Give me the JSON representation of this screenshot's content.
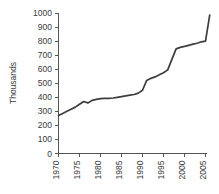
{
  "chart_data": {
    "type": "line",
    "title": "",
    "subtitle": "",
    "xlabel": "",
    "ylabel": "Thousands",
    "xlim": [
      1970,
      2006
    ],
    "ylim": [
      0,
      1000
    ],
    "grid": false,
    "legend": false,
    "legend_position": "none",
    "x_tick_labels": [
      "1970",
      "1975",
      "1980",
      "1985",
      "1990",
      "1995",
      "2000",
      "2005"
    ],
    "x_ticks": [
      1970,
      1975,
      1980,
      1985,
      1990,
      1995,
      2000,
      2005
    ],
    "y_tick_labels": [
      "0",
      "100",
      "200",
      "300",
      "400",
      "500",
      "600",
      "700",
      "800",
      "900",
      "1000"
    ],
    "y_ticks": [
      0,
      100,
      200,
      300,
      400,
      500,
      600,
      700,
      800,
      900,
      1000
    ],
    "x_tick_label_rotation": -90,
    "series": [
      {
        "name": "series-1",
        "color": "#3d3d3d",
        "x": [
          1970,
          1971,
          1972,
          1973,
          1974,
          1975,
          1976,
          1977,
          1978,
          1979,
          1980,
          1981,
          1982,
          1983,
          1984,
          1985,
          1986,
          1987,
          1988,
          1989,
          1990,
          1991,
          1992,
          1993,
          1994,
          1995,
          1996,
          1997,
          1998,
          1999,
          2000,
          2001,
          2002,
          2003,
          2004,
          2005,
          2006
        ],
        "values": [
          270,
          285,
          300,
          315,
          330,
          350,
          370,
          360,
          378,
          385,
          390,
          392,
          393,
          395,
          400,
          405,
          410,
          415,
          420,
          430,
          450,
          520,
          535,
          545,
          560,
          575,
          595,
          670,
          745,
          755,
          762,
          770,
          778,
          785,
          795,
          800,
          985
        ]
      }
    ]
  },
  "axis": {
    "y_axis_title": "Thousands"
  }
}
